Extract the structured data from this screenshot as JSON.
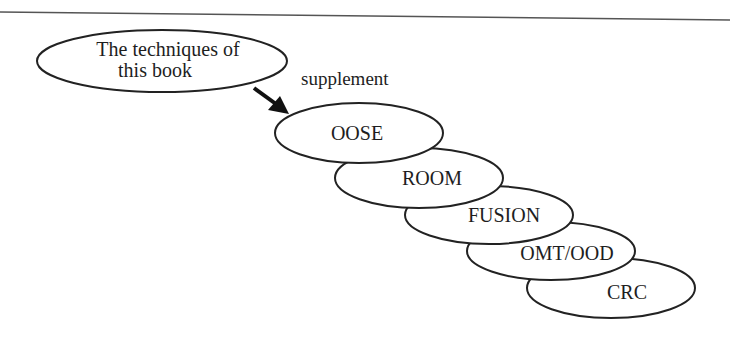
{
  "diagram": {
    "source_node": {
      "lines": [
        "The techniques of",
        "this book"
      ]
    },
    "relation_label": "supplement",
    "methods": [
      {
        "label": "OOSE"
      },
      {
        "label": "ROOM"
      },
      {
        "label": "FUSION"
      },
      {
        "label": "OMT/OOD"
      },
      {
        "label": "CRC"
      }
    ]
  },
  "colors": {
    "stroke": "#222222",
    "text": "#1e1e1e",
    "background": "#ffffff"
  }
}
